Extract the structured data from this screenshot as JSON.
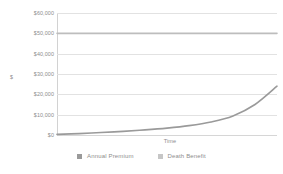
{
  "chart_data": {
    "type": "line",
    "title": "",
    "xlabel": "Time",
    "ylabel": "$",
    "ylim": [
      0,
      60000
    ],
    "yticks": [
      "$0",
      "$10,000",
      "$20,000",
      "$30,000",
      "$40,000",
      "$50,000",
      "$60,000"
    ],
    "ytick_values": [
      0,
      10000,
      20000,
      30000,
      40000,
      50000,
      60000
    ],
    "xticks": [],
    "grid": true,
    "legend_position": "bottom",
    "x": [
      0,
      10,
      20,
      30,
      40,
      50,
      60,
      70,
      80,
      90,
      100
    ],
    "series": [
      {
        "name": "Annual Premium",
        "color": "#9a9a9a",
        "values": [
          300,
          700,
          1200,
          1800,
          2500,
          3400,
          4600,
          6400,
          9400,
          15000,
          24000
        ]
      },
      {
        "name": "Death Benefit",
        "color": "#bdbdbd",
        "values": [
          50000,
          50000,
          50000,
          50000,
          50000,
          50000,
          50000,
          50000,
          50000,
          50000,
          50000
        ]
      }
    ]
  },
  "axes": {
    "y_title": "$",
    "x_title": "Time"
  },
  "legend": {
    "items": [
      {
        "label": "Annual Premium",
        "swatch_color": "#9a9a9a"
      },
      {
        "label": "Death Benefit",
        "swatch_color": "#c6c6c6"
      }
    ]
  },
  "colors": {
    "background": "#ffffff",
    "gridline": "#e2e2e2",
    "axis": "#d2d2d2",
    "text": "#8d8d8d"
  }
}
